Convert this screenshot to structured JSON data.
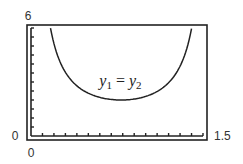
{
  "chart_data": {
    "type": "line",
    "title": "",
    "xlabel": "",
    "ylabel": "",
    "xlim": [
      0,
      1.5
    ],
    "ylim": [
      0,
      6
    ],
    "x_tick_step": 0.1,
    "y_tick_step": 0.5,
    "grid": false,
    "x_tick_labels": {
      "min": "0",
      "max": "1.5"
    },
    "y_tick_labels": {
      "min": "0",
      "max": "6"
    },
    "annotation": {
      "var": "y",
      "sub1": "1",
      "eq": " = ",
      "sub2": "2",
      "x": 0.78,
      "y": 2.8
    },
    "series": [
      {
        "name": "y1 = y2",
        "function": "2/sin(2x)",
        "x_range": [
          0.17,
          1.4
        ],
        "x": [
          0.17,
          0.2,
          0.25,
          0.3,
          0.35,
          0.4,
          0.5,
          0.6,
          0.7,
          0.785,
          0.9,
          1.0,
          1.1,
          1.2,
          1.3,
          1.35,
          1.4
        ],
        "y": [
          6.0,
          5.14,
          4.17,
          3.54,
          3.11,
          2.79,
          2.38,
          2.15,
          2.03,
          2.0,
          2.05,
          2.2,
          2.47,
          2.96,
          3.88,
          4.66,
          5.97
        ]
      }
    ],
    "line_color": "#222222",
    "frame_color": "#222222"
  }
}
